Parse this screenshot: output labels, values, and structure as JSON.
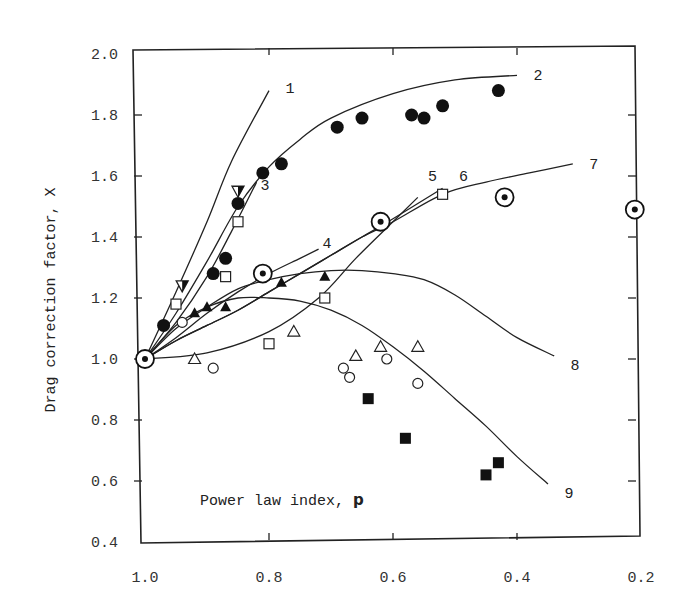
{
  "chart_data": {
    "type": "scatter",
    "title": "",
    "xlabel": "Power law index, p",
    "xlabel_text": "Power law index, ",
    "xlabel_var": "p",
    "ylabel": "Drag correction factor, X",
    "xlim": [
      1.0,
      0.2
    ],
    "ylim": [
      0.4,
      2.0
    ],
    "x_reversed": true,
    "grid": false,
    "legend": "none (curves numbered 1-9 inline)",
    "x_ticks": [
      "1.0",
      "0.8",
      "0.6",
      "0.4",
      "0.2"
    ],
    "y_ticks": [
      "2.0",
      "1.8",
      "1.6",
      "1.4",
      "1.2",
      "1.0",
      "0.8",
      "0.6",
      "0.4"
    ],
    "curves": [
      {
        "name": "1",
        "points": [
          [
            1.0,
            1.0
          ],
          [
            0.95,
            1.22
          ],
          [
            0.9,
            1.45
          ],
          [
            0.86,
            1.65
          ],
          [
            0.8,
            1.88
          ]
        ],
        "label_at": [
          0.78,
          1.89
        ]
      },
      {
        "name": "2",
        "points": [
          [
            1.0,
            1.0
          ],
          [
            0.95,
            1.15
          ],
          [
            0.9,
            1.32
          ],
          [
            0.85,
            1.5
          ],
          [
            0.8,
            1.63
          ],
          [
            0.75,
            1.72
          ],
          [
            0.7,
            1.79
          ],
          [
            0.6,
            1.87
          ],
          [
            0.5,
            1.915
          ],
          [
            0.4,
            1.93
          ]
        ],
        "label_at": [
          0.38,
          1.93
        ]
      },
      {
        "name": "3",
        "points": [
          [
            1.0,
            1.0
          ],
          [
            0.95,
            1.12
          ],
          [
            0.9,
            1.27
          ],
          [
            0.86,
            1.42
          ],
          [
            0.82,
            1.58
          ]
        ],
        "label_at": [
          0.82,
          1.57
        ]
      },
      {
        "name": "4",
        "points": [
          [
            1.0,
            1.0
          ],
          [
            0.95,
            1.07
          ],
          [
            0.9,
            1.15
          ],
          [
            0.85,
            1.22
          ],
          [
            0.8,
            1.28
          ],
          [
            0.75,
            1.33
          ],
          [
            0.72,
            1.36
          ]
        ],
        "label_at": [
          0.72,
          1.38
        ]
      },
      {
        "name": "5",
        "points": [
          [
            1.0,
            1.0
          ],
          [
            0.9,
            1.02
          ],
          [
            0.8,
            1.09
          ],
          [
            0.72,
            1.2
          ],
          [
            0.66,
            1.33
          ],
          [
            0.6,
            1.45
          ],
          [
            0.56,
            1.53
          ]
        ],
        "label_at": [
          0.55,
          1.6
        ]
      },
      {
        "name": "6",
        "points": [
          [
            1.0,
            1.0
          ],
          [
            0.95,
            1.06
          ],
          [
            0.9,
            1.11
          ],
          [
            0.85,
            1.16
          ],
          [
            0.8,
            1.22
          ],
          [
            0.75,
            1.28
          ],
          [
            0.7,
            1.34
          ],
          [
            0.65,
            1.4
          ],
          [
            0.6,
            1.46
          ],
          [
            0.52,
            1.56
          ]
        ],
        "label_at": [
          0.5,
          1.6
        ]
      },
      {
        "name": "7",
        "points": [
          [
            1.0,
            1.0
          ],
          [
            0.95,
            1.06
          ],
          [
            0.9,
            1.11
          ],
          [
            0.85,
            1.16
          ],
          [
            0.8,
            1.22
          ],
          [
            0.75,
            1.28
          ],
          [
            0.7,
            1.34
          ],
          [
            0.65,
            1.4
          ],
          [
            0.6,
            1.45
          ],
          [
            0.52,
            1.54
          ],
          [
            0.45,
            1.58
          ],
          [
            0.38,
            1.61
          ],
          [
            0.31,
            1.64
          ]
        ],
        "label_at": [
          0.29,
          1.64
        ]
      },
      {
        "name": "8",
        "points": [
          [
            1.0,
            1.0
          ],
          [
            0.95,
            1.1
          ],
          [
            0.9,
            1.17
          ],
          [
            0.85,
            1.23
          ],
          [
            0.8,
            1.26
          ],
          [
            0.75,
            1.28
          ],
          [
            0.7,
            1.29
          ],
          [
            0.65,
            1.29
          ],
          [
            0.6,
            1.28
          ],
          [
            0.55,
            1.26
          ],
          [
            0.5,
            1.21
          ],
          [
            0.45,
            1.14
          ],
          [
            0.4,
            1.07
          ],
          [
            0.34,
            1.01
          ]
        ],
        "label_at": [
          0.32,
          0.98
        ]
      },
      {
        "name": "9",
        "points": [
          [
            1.0,
            1.0
          ],
          [
            0.95,
            1.11
          ],
          [
            0.9,
            1.17
          ],
          [
            0.85,
            1.2
          ],
          [
            0.8,
            1.2
          ],
          [
            0.75,
            1.19
          ],
          [
            0.7,
            1.16
          ],
          [
            0.65,
            1.11
          ],
          [
            0.6,
            1.04
          ],
          [
            0.55,
            0.96
          ],
          [
            0.5,
            0.87
          ],
          [
            0.45,
            0.78
          ],
          [
            0.4,
            0.68
          ],
          [
            0.35,
            0.59
          ]
        ],
        "label_at": [
          0.33,
          0.56
        ]
      }
    ],
    "series": [
      {
        "name": "filled circles",
        "marker": "filled-circle",
        "x": [
          0.97,
          0.89,
          0.87,
          0.85,
          0.81,
          0.78,
          0.69,
          0.65,
          0.57,
          0.55,
          0.52,
          0.43
        ],
        "y": [
          1.11,
          1.28,
          1.33,
          1.51,
          1.61,
          1.64,
          1.76,
          1.79,
          1.8,
          1.79,
          1.83,
          1.88
        ]
      },
      {
        "name": "open circles",
        "marker": "open-circle",
        "x": [
          0.89,
          0.68,
          0.67,
          0.61,
          0.56,
          0.94
        ],
        "y": [
          0.97,
          0.97,
          0.94,
          1.0,
          0.92,
          1.12
        ]
      },
      {
        "name": "filled triangles",
        "marker": "filled-triangle",
        "x": [
          0.92,
          0.9,
          0.87,
          0.78,
          0.71
        ],
        "y": [
          1.15,
          1.17,
          1.17,
          1.25,
          1.27
        ]
      },
      {
        "name": "open triangles",
        "marker": "open-triangle",
        "x": [
          0.92,
          0.76,
          0.66,
          0.62,
          0.56
        ],
        "y": [
          1.0,
          1.09,
          1.01,
          1.04,
          1.04
        ]
      },
      {
        "name": "open squares",
        "marker": "open-square",
        "x": [
          0.95,
          0.87,
          0.8,
          0.71,
          0.52,
          0.85
        ],
        "y": [
          1.18,
          1.27,
          1.05,
          1.2,
          1.54,
          1.45
        ]
      },
      {
        "name": "filled squares",
        "marker": "filled-square",
        "x": [
          0.64,
          0.58,
          0.45,
          0.43
        ],
        "y": [
          0.87,
          0.74,
          0.62,
          0.66
        ]
      },
      {
        "name": "half-filled triangles",
        "marker": "half-triangle",
        "x": [
          0.94,
          0.85
        ],
        "y": [
          1.24,
          1.55
        ]
      },
      {
        "name": "dotted circles",
        "marker": "circle-dot",
        "x": [
          1.0,
          0.81,
          0.62,
          0.42,
          0.21
        ],
        "y": [
          1.0,
          1.28,
          1.45,
          1.53,
          1.49
        ]
      }
    ]
  }
}
